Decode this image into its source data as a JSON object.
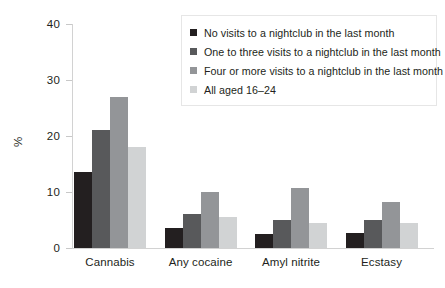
{
  "chart_data": {
    "type": "bar",
    "title": "",
    "subtitle": "",
    "xlabel": "",
    "ylabel": "%",
    "ylim": [
      0,
      40
    ],
    "yticks": [
      "0",
      "10",
      "20",
      "30",
      "40"
    ],
    "ytick_values": [
      0,
      10,
      20,
      30,
      40
    ],
    "grid": false,
    "legend_position": "top-right",
    "categories": [
      "Cannabis",
      "Any cocaine",
      "Amyl nitrite",
      "Ecstasy"
    ],
    "series": [
      {
        "name": "No visits to a nightclub in the last month",
        "color": "#231f20",
        "values": [
          13.5,
          3.5,
          2.5,
          2.7
        ]
      },
      {
        "name": "One to three visits to a nightclub in the last month",
        "color": "#58595b",
        "values": [
          21.0,
          6.0,
          5.0,
          5.0
        ]
      },
      {
        "name": "Four or more visits to a nightclub in the last month",
        "color": "#939598",
        "values": [
          27.0,
          10.0,
          10.7,
          8.3
        ]
      },
      {
        "name": "All aged 16–24",
        "color": "#d1d3d4",
        "values": [
          18.0,
          5.5,
          4.5,
          4.5
        ]
      }
    ]
  },
  "axis": {
    "y_title": "%"
  },
  "colors": {
    "axis_line": "#d2d2d2",
    "tick_mark": "#c8c8c8",
    "text": "#231f20",
    "legend_border": "#e6e6e6",
    "background": "#ffffff"
  }
}
